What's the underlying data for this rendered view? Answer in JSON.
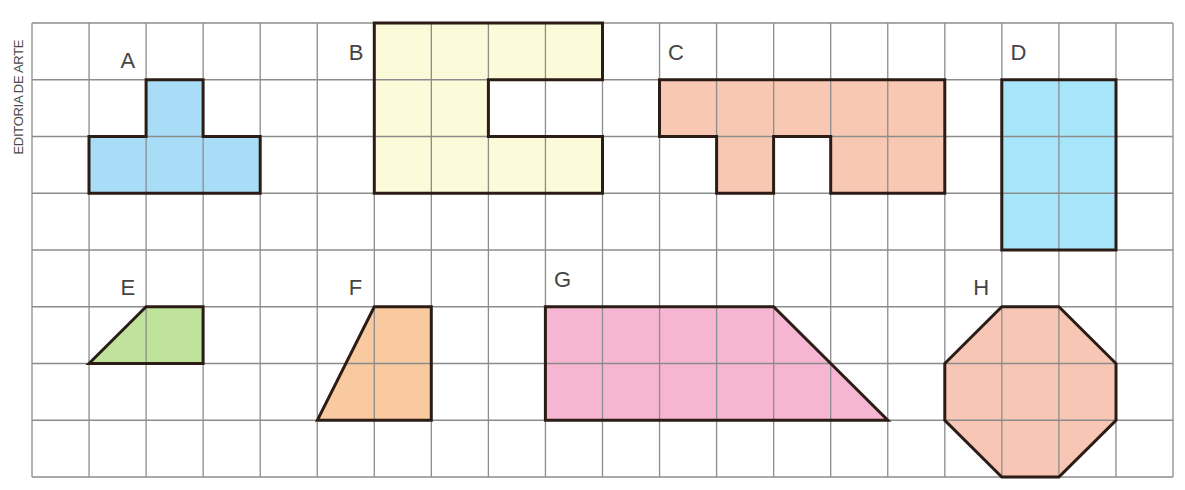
{
  "credit": "EDITORIA DE ARTE",
  "grid": {
    "x0": 32,
    "y0": 23,
    "cols": 20,
    "rows": 8,
    "cell_w": 57.05,
    "cell_h": 56.75,
    "line_color": "#8c8c8c",
    "border_color": "#8c8c8c"
  },
  "shapes": [
    {
      "label": "A",
      "fill": "#a9ddf7",
      "label_pos": [
        1.55,
        0.8
      ],
      "points": [
        [
          1,
          3
        ],
        [
          1,
          2
        ],
        [
          2,
          2
        ],
        [
          2,
          1
        ],
        [
          3,
          1
        ],
        [
          3,
          2
        ],
        [
          4,
          2
        ],
        [
          4,
          3
        ]
      ]
    },
    {
      "label": "B",
      "fill": "#fbfad9",
      "label_pos": [
        5.55,
        0.65
      ],
      "points": [
        [
          6,
          0
        ],
        [
          10,
          0
        ],
        [
          10,
          1
        ],
        [
          8,
          1
        ],
        [
          8,
          2
        ],
        [
          10,
          2
        ],
        [
          10,
          3
        ],
        [
          6,
          3
        ]
      ]
    },
    {
      "label": "C",
      "fill": "#f8c8b3",
      "label_pos": [
        11.15,
        0.65
      ],
      "points": [
        [
          11,
          1
        ],
        [
          16,
          1
        ],
        [
          16,
          3
        ],
        [
          14,
          3
        ],
        [
          14,
          2
        ],
        [
          13,
          2
        ],
        [
          13,
          3
        ],
        [
          12,
          3
        ],
        [
          12,
          2
        ],
        [
          11,
          2
        ]
      ]
    },
    {
      "label": "D",
      "fill": "#a7e6fa",
      "label_pos": [
        17.15,
        0.65
      ],
      "points": [
        [
          17,
          1
        ],
        [
          19,
          1
        ],
        [
          19,
          4
        ],
        [
          17,
          4
        ]
      ]
    },
    {
      "label": "E",
      "fill": "#bfe39a",
      "label_pos": [
        1.55,
        4.8
      ],
      "points": [
        [
          1,
          6
        ],
        [
          2,
          5
        ],
        [
          3,
          5
        ],
        [
          3,
          6
        ]
      ]
    },
    {
      "label": "F",
      "fill": "#f9c9a0",
      "label_pos": [
        5.55,
        4.8
      ],
      "points": [
        [
          5,
          7
        ],
        [
          6,
          5
        ],
        [
          7,
          5
        ],
        [
          7,
          7
        ]
      ]
    },
    {
      "label": "G",
      "fill": "#f6b5d1",
      "label_pos": [
        9.15,
        4.65
      ],
      "points": [
        [
          9,
          5
        ],
        [
          13,
          5
        ],
        [
          15,
          7
        ],
        [
          9,
          7
        ]
      ]
    },
    {
      "label": "H",
      "fill": "#f8c6b4",
      "label_pos": [
        16.5,
        4.8
      ],
      "points": [
        [
          16,
          6
        ],
        [
          17,
          5
        ],
        [
          18,
          5
        ],
        [
          19,
          6
        ],
        [
          19,
          7
        ],
        [
          18,
          8
        ],
        [
          17,
          8
        ],
        [
          16,
          7
        ]
      ]
    }
  ]
}
